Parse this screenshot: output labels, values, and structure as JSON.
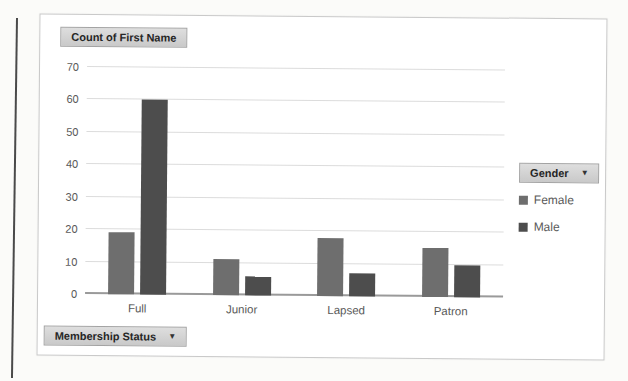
{
  "chart": {
    "value_field_button": "Count of First Name",
    "legend_field_button": "Gender",
    "axis_field_button": "Membership Status",
    "dropdown_arrow": "▼"
  },
  "chart_data": {
    "type": "bar",
    "title": "Count of First Name",
    "categories": [
      "Full",
      "Junior",
      "Lapsed",
      "Patron"
    ],
    "series": [
      {
        "name": "Female",
        "values": [
          19,
          11,
          18,
          15
        ],
        "color": "#6e6e6e"
      },
      {
        "name": "Male",
        "values": [
          60,
          6,
          7,
          10
        ],
        "color": "#4d4d4d"
      }
    ],
    "xlabel": "Membership Status",
    "ylabel": "",
    "ylim": [
      0,
      70
    ],
    "yticks": [
      0,
      10,
      20,
      30,
      40,
      50,
      60,
      70
    ],
    "grid": true,
    "legend_title": "Gender",
    "legend_position": "right"
  }
}
